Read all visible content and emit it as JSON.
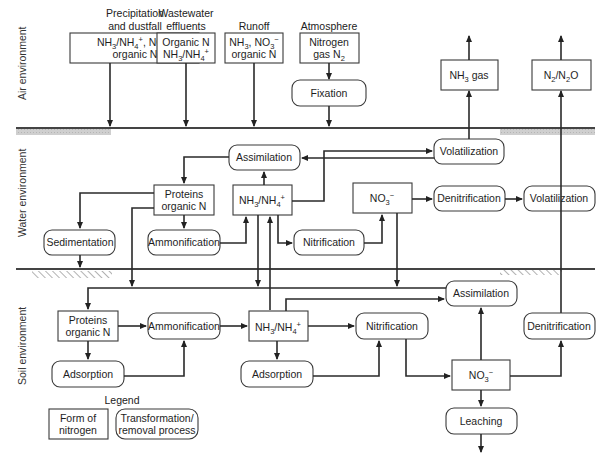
{
  "diagram": {
    "zones": {
      "air": "Air environment",
      "water": "Water environment",
      "soil": "Soil environment"
    },
    "sources": [
      {
        "heading": [
          "Precipitation",
          "and dustfall"
        ],
        "lines": [
          "NH3/NH4+, NO3-",
          "organic N"
        ]
      },
      {
        "heading": [
          "Wastewater",
          "effluents"
        ],
        "lines": [
          "Organic N",
          "NH3/NH4+"
        ]
      },
      {
        "heading": [
          "Runoff"
        ],
        "lines": [
          "NH3, NO3-",
          "organic N"
        ]
      },
      {
        "heading": [
          "Atmosphere"
        ],
        "lines": [
          "Nitrogen",
          "gas N2"
        ]
      }
    ],
    "air_nodes": {
      "fixation": "Fixation",
      "nh3_gas": "NH3 gas",
      "n2_n2o": "N2/N2O"
    },
    "water_nodes": {
      "assimilation": "Assimilation",
      "volatilization_1": "Volatilization",
      "proteins": [
        "Proteins",
        "organic N"
      ],
      "nh3_nh4": "NH3/NH4+",
      "no3": "NO3-",
      "denitrification": "Denitrification",
      "volatilization_2": "Volatilization",
      "sedimentation": "Sedimentation",
      "ammonification": "Ammonification",
      "nitrification": "Nitrification"
    },
    "soil_nodes": {
      "assimilation": "Assimilation",
      "proteins": [
        "Proteins",
        "organic N"
      ],
      "ammonification": "Ammonification",
      "nh3_nh4": "NH3/NH4+",
      "nitrification": "Nitrification",
      "denitrification": "Denitrification",
      "adsorption_1": "Adsorption",
      "adsorption_2": "Adsorption",
      "no3": "NO3-",
      "leaching": "Leaching"
    },
    "legend": {
      "title": "Legend",
      "form": [
        "Form of",
        "nitrogen"
      ],
      "process": [
        "Transformation/",
        "removal process"
      ]
    }
  }
}
